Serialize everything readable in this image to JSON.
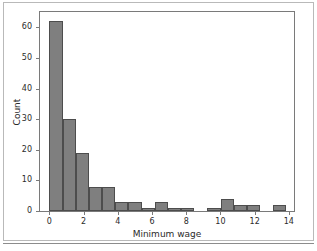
{
  "chart_data": {
    "type": "bar",
    "title": "",
    "xlabel": "Minimum wage",
    "ylabel": "Count",
    "xlim": [
      -0.55,
      14.3
    ],
    "ylim": [
      0,
      65
    ],
    "grid": false,
    "legend": null,
    "bin_width": 0.77,
    "xticks": [
      "0",
      "2",
      "4",
      "6",
      "8",
      "10",
      "12",
      "14"
    ],
    "xtick_values": [
      0,
      2,
      4,
      6,
      8,
      10,
      12,
      14
    ],
    "yticks": [
      "0",
      "10",
      "20",
      "30",
      "40",
      "50",
      "60"
    ],
    "ytick_values": [
      0,
      10,
      20,
      30,
      40,
      50,
      60
    ],
    "bar_color": "#7f7f7f",
    "bar_edge_color": "#4d4d4d",
    "bins": [
      {
        "x0": 0.0,
        "x1": 0.77,
        "value": 62
      },
      {
        "x0": 0.77,
        "x1": 1.54,
        "value": 30
      },
      {
        "x0": 1.54,
        "x1": 2.31,
        "value": 19
      },
      {
        "x0": 2.31,
        "x1": 3.08,
        "value": 8
      },
      {
        "x0": 3.08,
        "x1": 3.85,
        "value": 8
      },
      {
        "x0": 3.85,
        "x1": 4.62,
        "value": 3
      },
      {
        "x0": 4.62,
        "x1": 5.39,
        "value": 3
      },
      {
        "x0": 5.39,
        "x1": 6.16,
        "value": 1
      },
      {
        "x0": 6.16,
        "x1": 6.93,
        "value": 3
      },
      {
        "x0": 6.93,
        "x1": 7.7,
        "value": 1
      },
      {
        "x0": 7.7,
        "x1": 8.47,
        "value": 1
      },
      {
        "x0": 8.47,
        "x1": 9.24,
        "value": 0
      },
      {
        "x0": 9.24,
        "x1": 10.01,
        "value": 1
      },
      {
        "x0": 10.01,
        "x1": 10.78,
        "value": 4
      },
      {
        "x0": 10.78,
        "x1": 11.55,
        "value": 2
      },
      {
        "x0": 11.55,
        "x1": 12.32,
        "value": 2
      },
      {
        "x0": 12.32,
        "x1": 13.09,
        "value": 0
      },
      {
        "x0": 13.09,
        "x1": 13.86,
        "value": 2
      }
    ],
    "categories": [
      "0.0-0.77",
      "0.77-1.54",
      "1.54-2.31",
      "2.31-3.08",
      "3.08-3.85",
      "3.85-4.62",
      "4.62-5.39",
      "5.39-6.16",
      "6.16-6.93",
      "6.93-7.70",
      "7.70-8.47",
      "8.47-9.24",
      "9.24-10.01",
      "10.01-10.78",
      "10.78-11.55",
      "11.55-12.32",
      "12.32-13.09",
      "13.09-13.86"
    ],
    "values": [
      62,
      30,
      19,
      8,
      8,
      3,
      3,
      1,
      3,
      1,
      1,
      0,
      1,
      4,
      2,
      2,
      0,
      2
    ]
  }
}
